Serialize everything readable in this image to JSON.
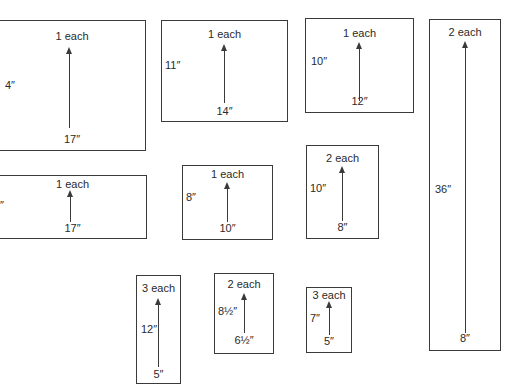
{
  "pieces": [
    {
      "qty": "1 each",
      "length": "4″",
      "width": "17″"
    },
    {
      "qty": "1 each",
      "length": "11″",
      "width": "14″"
    },
    {
      "qty": "1 each",
      "length": "10″",
      "width": "12″"
    },
    {
      "qty": "2 each",
      "length": "36″",
      "width": "8″"
    },
    {
      "qty": "1 each",
      "length": "7″",
      "width": "17″"
    },
    {
      "qty": "1 each",
      "length": "8″",
      "width": "10″"
    },
    {
      "qty": "2 each",
      "length": "10″",
      "width": "8″"
    },
    {
      "qty": "3 each",
      "length": "12″",
      "width": "5″"
    },
    {
      "qty": "2 each",
      "length": "8½″",
      "width": "6½″"
    },
    {
      "qty": "3 each",
      "length": "7″",
      "width": "5″"
    }
  ]
}
